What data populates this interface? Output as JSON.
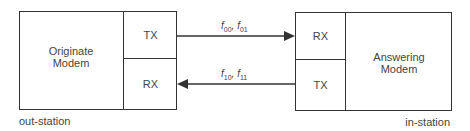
{
  "diagram": {
    "originate": {
      "title_line1": "Originate",
      "title_line2": "Modem",
      "tx_label": "TX",
      "rx_label": "RX",
      "station_label": "out-station"
    },
    "answering": {
      "title_line1": "Answering",
      "title_line2": "Modem",
      "rx_label": "RX",
      "tx_label": "TX",
      "station_label": "in-station"
    },
    "links": [
      {
        "direction": "originate-to-answering",
        "freq_a": "f",
        "freq_a_sub": "00",
        "separator": ", ",
        "freq_b": "f",
        "freq_b_sub": "01"
      },
      {
        "direction": "answering-to-originate",
        "freq_a": "f",
        "freq_a_sub": "10",
        "separator": ", ",
        "freq_b": "f",
        "freq_b_sub": "11"
      }
    ],
    "colors": {
      "line": "#333333",
      "text": "#444444",
      "background": "#ffffff"
    }
  }
}
